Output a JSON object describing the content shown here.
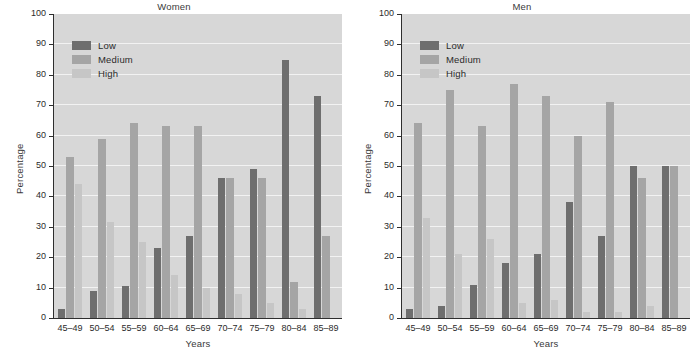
{
  "figure": {
    "width": 696,
    "height": 356,
    "background": "#ffffff",
    "plot_background": "#d7d7d7",
    "gridline_color": "#f2f2f2",
    "axis_color": "#2e2e2e"
  },
  "series_colors": {
    "Low": "#6e6e6e",
    "Medium": "#a5a5a5",
    "High": "#c6c6c6"
  },
  "legend": {
    "position": "upper-left-inside",
    "entries": [
      {
        "label": "Low",
        "color": "#6e6e6e"
      },
      {
        "label": "Medium",
        "color": "#a5a5a5"
      },
      {
        "label": "High",
        "color": "#c6c6c6"
      }
    ]
  },
  "axis": {
    "ylabel": "Percentage",
    "xlabel": "Years",
    "ylim": [
      0,
      100
    ],
    "yticks": [
      0,
      10,
      20,
      30,
      40,
      50,
      60,
      70,
      80,
      90,
      100
    ],
    "yticklabels": [
      "0",
      "10",
      "20",
      "30",
      "40",
      "50",
      "60",
      "70",
      "80",
      "90",
      "100"
    ]
  },
  "chart_data": [
    {
      "type": "bar",
      "title": "Women",
      "xlabel": "Years",
      "ylabel": "Percentage",
      "ylim": [
        0,
        100
      ],
      "grid": true,
      "legend": "upper left",
      "categories": [
        "45–49",
        "50–54",
        "55–59",
        "60–64",
        "65–69",
        "70–74",
        "75–79",
        "80–84",
        "85–89"
      ],
      "series": [
        {
          "name": "Low",
          "color": "#6e6e6e",
          "values": [
            3,
            9,
            10.5,
            23,
            27,
            46,
            49,
            85,
            73
          ]
        },
        {
          "name": "Medium",
          "color": "#a5a5a5",
          "values": [
            53,
            59,
            64,
            63,
            63,
            46,
            46,
            12,
            27
          ]
        },
        {
          "name": "High",
          "color": "#c6c6c6",
          "values": [
            44,
            31.5,
            25,
            14,
            10,
            8,
            5,
            3,
            0
          ]
        }
      ]
    },
    {
      "type": "bar",
      "title": "Men",
      "xlabel": "Years",
      "ylabel": "Percentage",
      "ylim": [
        0,
        100
      ],
      "grid": true,
      "legend": "upper left",
      "categories": [
        "45–49",
        "50–54",
        "55–59",
        "60–64",
        "65–69",
        "70–74",
        "75–79",
        "80–84",
        "85–89"
      ],
      "series": [
        {
          "name": "Low",
          "color": "#6e6e6e",
          "values": [
            3,
            4,
            11,
            18,
            21,
            38,
            27,
            50,
            50
          ]
        },
        {
          "name": "Medium",
          "color": "#a5a5a5",
          "values": [
            64,
            75,
            63,
            77,
            73,
            60,
            71,
            46,
            50
          ]
        },
        {
          "name": "High",
          "color": "#c6c6c6",
          "values": [
            33,
            21,
            26,
            5,
            6,
            2,
            2,
            4,
            0
          ]
        }
      ]
    }
  ]
}
